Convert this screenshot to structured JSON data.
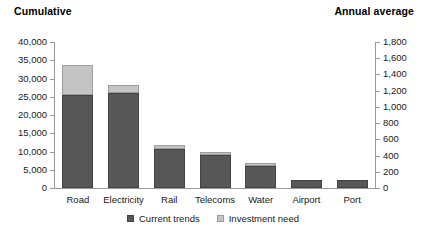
{
  "chart_data": {
    "type": "bar",
    "title": "",
    "subtitle": "",
    "stacked": true,
    "grid": false,
    "legend_position": "bottom-center",
    "categories": [
      "Road",
      "Electricity",
      "Rail",
      "Telecoms",
      "Water",
      "Airport",
      "Port"
    ],
    "series": [
      {
        "name": "Current trends",
        "color": "#575757",
        "values": [
          25500,
          26000,
          10700,
          9000,
          6100,
          2200,
          2200
        ]
      },
      {
        "name": "Investment need",
        "color": "#c4c4c4",
        "values": [
          8100,
          2200,
          1100,
          900,
          800,
          0,
          0
        ]
      }
    ],
    "totals": [
      33600,
      28200,
      11800,
      9900,
      6900,
      2200,
      2200
    ],
    "xlabel": "",
    "ylabel": "Cumulative",
    "ylabel_right": "Annual average",
    "ylim": [
      0,
      40000
    ],
    "ylim_right": [
      0,
      1800
    ],
    "yticks": [
      0,
      5000,
      10000,
      15000,
      20000,
      25000,
      30000,
      35000,
      40000
    ],
    "yticklabels": [
      "0",
      "5,000",
      "10,000",
      "15,000",
      "20,000",
      "25,000",
      "30,000",
      "35,000",
      "40,000"
    ],
    "yticks_right": [
      0,
      200,
      400,
      600,
      800,
      1000,
      1200,
      1400,
      1600,
      1800
    ],
    "yticklabels_right": [
      "0",
      "200",
      "400",
      "600",
      "800",
      "1,000",
      "1,200",
      "1,400",
      "1,600",
      "1,800"
    ]
  },
  "axis_titles": {
    "left": "Cumulative",
    "right": "Annual average"
  },
  "legend": [
    {
      "label": "Current trends",
      "swatch": "dark"
    },
    {
      "label": "Investment need",
      "swatch": "light"
    }
  ]
}
